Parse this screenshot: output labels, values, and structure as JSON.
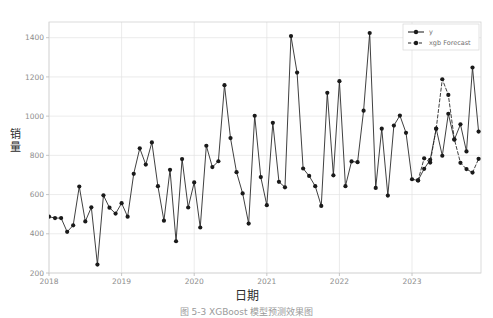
{
  "figure": {
    "background": "#ffffff",
    "caption": "图 5-3  XGBoost 模型预测效果图"
  },
  "chart_data": {
    "type": "line",
    "title": "",
    "xlabel": "日期",
    "ylabel": "销量",
    "grid": true,
    "legend_position": "top-right",
    "xlim": [
      2018.0,
      2023.95
    ],
    "ylim": [
      200,
      1480
    ],
    "yticks": [
      200,
      400,
      600,
      800,
      1000,
      1200,
      1400
    ],
    "ytick_labels": [
      "200",
      "400",
      "600",
      "800",
      "1000",
      "1200",
      "1400"
    ],
    "xticks": [
      2018,
      2019,
      2020,
      2021,
      2022,
      2023
    ],
    "xtick_labels": [
      "2018",
      "2019",
      "2020",
      "2021",
      "2022",
      "2023"
    ],
    "line_color": "#2a2a2a",
    "marker_color": "#1a1a1a",
    "series": [
      {
        "name": "y",
        "style": "solid",
        "marker": "circle",
        "x": [
          2018.0,
          2018.083,
          2018.167,
          2018.25,
          2018.333,
          2018.417,
          2018.5,
          2018.583,
          2018.667,
          2018.75,
          2018.833,
          2018.917,
          2019.0,
          2019.083,
          2019.167,
          2019.25,
          2019.333,
          2019.417,
          2019.5,
          2019.583,
          2019.667,
          2019.75,
          2019.833,
          2019.917,
          2020.0,
          2020.083,
          2020.167,
          2020.25,
          2020.333,
          2020.417,
          2020.5,
          2020.583,
          2020.667,
          2020.75,
          2020.833,
          2020.917,
          2021.0,
          2021.083,
          2021.167,
          2021.25,
          2021.333,
          2021.417,
          2021.5,
          2021.583,
          2021.667,
          2021.75,
          2021.833,
          2021.917,
          2022.0,
          2022.083,
          2022.167,
          2022.25,
          2022.333,
          2022.417,
          2022.5,
          2022.583,
          2022.667,
          2022.75,
          2022.833,
          2022.917,
          2023.0,
          2023.083,
          2023.167,
          2023.25,
          2023.333,
          2023.417,
          2023.5,
          2023.583,
          2023.667,
          2023.75,
          2023.833,
          2023.917
        ],
        "values": [
          487,
          480,
          480,
          410,
          443,
          641,
          463,
          535,
          243,
          596,
          533,
          503,
          556,
          487,
          706,
          836,
          753,
          866,
          643,
          467,
          726,
          362,
          781,
          534,
          662,
          432,
          849,
          740,
          770,
          1158,
          888,
          714,
          606,
          452,
          1002,
          689,
          546,
          966,
          665,
          637,
          1408,
          1222,
          733,
          695,
          643,
          542,
          1119,
          698,
          1178,
          643,
          769,
          765,
          1028,
          1424,
          634,
          936,
          595,
          952,
          1003,
          915,
          678,
          672,
          731,
          777,
          936,
          798,
          1012,
          880,
          958,
          820,
          1248,
          921
        ]
      },
      {
        "name": "xgb Forecast",
        "style": "dashed",
        "marker": "circle",
        "x": [
          2023.083,
          2023.167,
          2023.25,
          2023.333,
          2023.417,
          2023.5,
          2023.583,
          2023.667,
          2023.75,
          2023.833,
          2023.917
        ],
        "values": [
          672,
          785,
          763,
          936,
          1188,
          1108,
          882,
          762,
          730,
          712,
          782
        ]
      }
    ]
  },
  "legend": {
    "entries": [
      {
        "label": "y",
        "style": "solid"
      },
      {
        "label": "xgb Forecast",
        "style": "dashed"
      }
    ]
  },
  "axis_titles": {
    "y_chars": [
      "销",
      "量"
    ],
    "x": "日期"
  }
}
